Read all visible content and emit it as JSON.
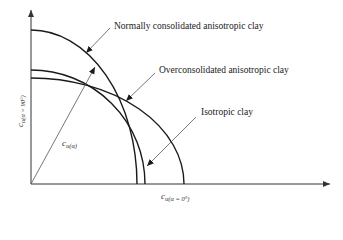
{
  "diagram": {
    "title": "",
    "colors": {
      "curve": "#1a1a1a",
      "axis": "#333333",
      "pointer": "#555555",
      "text": "#1a1a1a"
    },
    "axes": {
      "x_label_main": "c",
      "x_label_sub": "u(α = 0°)",
      "y_label_main": "c",
      "y_label_sub": "u(α = 90°)"
    },
    "vector": {
      "label_main": "c",
      "label_sub": "u(α)"
    },
    "curves": [
      {
        "id": "normally-consolidated",
        "label": "Normally consolidated anisotropic clay",
        "shape": "tall ellipse",
        "y_intercept_px": 30,
        "x_intercept_px": 137
      },
      {
        "id": "isotropic",
        "label": "Isotropic clay",
        "shape": "circle",
        "y_intercept_px": 70,
        "x_intercept_px": 145
      },
      {
        "id": "overconsolidated",
        "label": "Overconsolidated anisotropic clay",
        "shape": "wide ellipse",
        "y_intercept_px": 78,
        "x_intercept_px": 184
      }
    ]
  }
}
